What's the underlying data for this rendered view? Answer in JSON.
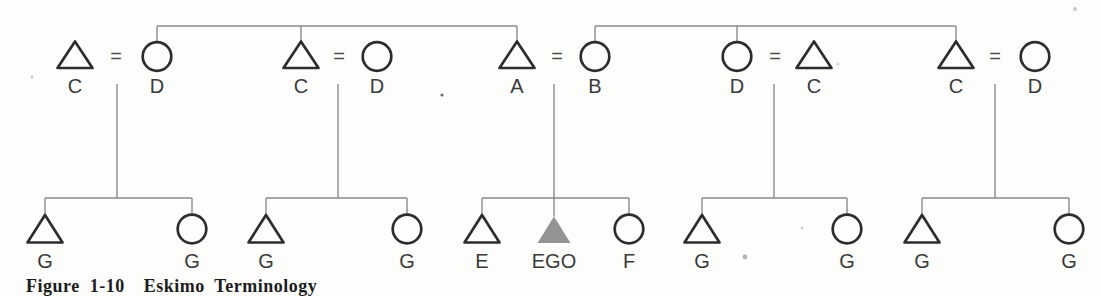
{
  "figure_type": "kinship-terminology-diagram (Eskimo system)",
  "colors": {
    "background": "#fdfdfc",
    "shape_stroke": "#2d2d2d",
    "connector": "#8a8a8a",
    "ego_fill": "#949494",
    "label": "#3a3a3a",
    "equals": "#4a4a4a",
    "caption": "#1c1c1c"
  },
  "caption": {
    "text": "Figure 1-10  Eskimo Terminology",
    "cropped": true
  },
  "diagram": {
    "layout": {
      "shape_w": 2.7,
      "connector_w": 1.4,
      "tri_half": 17.5,
      "circle_r": 14.3,
      "font_size": 20,
      "top_bar_y": 26,
      "drop_top_y": 84,
      "sibling_bar_y": 198,
      "parent": {
        "apex": 41.5,
        "base": 68,
        "circle_cy": 56.5,
        "label_y": 93,
        "eq_y": 63
      },
      "child": {
        "apex": 215,
        "base": 242.5,
        "circle_cy": 229,
        "label_y": 268
      },
      "ego": {
        "apex": 216.5,
        "base": 243,
        "half": 16.5
      }
    },
    "ancestor_links": [
      {
        "members": [
          {
            "x": 157,
            "attach": "circle"
          },
          {
            "x": 301,
            "attach": "apex"
          },
          {
            "x": 517,
            "attach": "apex"
          }
        ]
      },
      {
        "members": [
          {
            "x": 595,
            "attach": "circle"
          },
          {
            "x": 737,
            "attach": "circle"
          },
          {
            "x": 956,
            "attach": "apex"
          }
        ]
      }
    ],
    "families": [
      {
        "parents": [
          {
            "sex": "male",
            "label": "C",
            "x": 75
          },
          {
            "sex": "female",
            "label": "D",
            "x": 157
          }
        ],
        "eq_x": 116,
        "drop_x": 117,
        "children": [
          {
            "sex": "male",
            "label": "G",
            "x": 45
          },
          {
            "sex": "female",
            "label": "G",
            "x": 192
          }
        ]
      },
      {
        "parents": [
          {
            "sex": "male",
            "label": "C",
            "x": 301
          },
          {
            "sex": "female",
            "label": "D",
            "x": 377
          }
        ],
        "eq_x": 339,
        "drop_x": 338,
        "children": [
          {
            "sex": "male",
            "label": "G",
            "x": 266
          },
          {
            "sex": "female",
            "label": "G",
            "x": 407
          }
        ]
      },
      {
        "parents": [
          {
            "sex": "male",
            "label": "A",
            "x": 517
          },
          {
            "sex": "female",
            "label": "B",
            "x": 595
          }
        ],
        "eq_x": 557,
        "drop_x": 554,
        "children": [
          {
            "sex": "male",
            "label": "E",
            "x": 482
          },
          {
            "sex": "male",
            "label": "EGO",
            "x": 554,
            "ego": true
          },
          {
            "sex": "female",
            "label": "F",
            "x": 629
          }
        ]
      },
      {
        "parents": [
          {
            "sex": "female",
            "label": "D",
            "x": 737
          },
          {
            "sex": "male",
            "label": "C",
            "x": 814
          }
        ],
        "eq_x": 775,
        "drop_x": 774,
        "children": [
          {
            "sex": "male",
            "label": "G",
            "x": 702
          },
          {
            "sex": "female",
            "label": "G",
            "x": 847
          }
        ]
      },
      {
        "parents": [
          {
            "sex": "male",
            "label": "C",
            "x": 956
          },
          {
            "sex": "female",
            "label": "D",
            "x": 1035
          }
        ],
        "eq_x": 995,
        "drop_x": 995,
        "children": [
          {
            "sex": "male",
            "label": "G",
            "x": 922
          },
          {
            "sex": "female",
            "label": "G",
            "x": 1069
          }
        ]
      }
    ],
    "paper_specks": [
      {
        "x": 442,
        "y": 95,
        "r": 1.6,
        "color": "#6a6a6a"
      },
      {
        "x": 32,
        "y": 77,
        "r": 1.5,
        "color": "#c5c5c5"
      },
      {
        "x": 1075,
        "y": 9,
        "r": 2.0,
        "color": "#c8c8c8"
      },
      {
        "x": 745,
        "y": 257,
        "r": 2.4,
        "color": "#b5b5b5"
      },
      {
        "x": 802,
        "y": 228,
        "r": 1.5,
        "color": "#d2d2d2"
      },
      {
        "x": 838,
        "y": 64,
        "r": 1.5,
        "color": "#d8d8d8"
      }
    ]
  }
}
